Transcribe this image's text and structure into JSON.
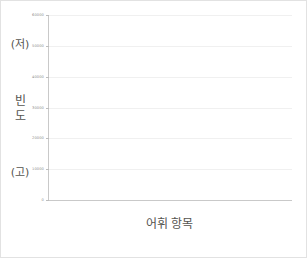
{
  "chart_data": {
    "type": "line",
    "title": "",
    "xlabel": "어휘 항목",
    "ylabel": "빈도",
    "ylim": [
      0,
      60000
    ],
    "grid": true,
    "legend_position": "none",
    "y_ticks": [
      0,
      10000,
      20000,
      30000,
      40000,
      50000,
      60000
    ],
    "y_tick_labels": [
      "0",
      "10000",
      "20000",
      "30000",
      "40000",
      "50000",
      "60000"
    ],
    "x_tick_labels": [],
    "annotations": {
      "y_axis_high_marker": "(저)",
      "y_axis_low_marker": "(고)"
    },
    "series": [
      {
        "name": "solid-curve",
        "style": "solid",
        "color": "#3a3a3a",
        "x": [
          0,
          2,
          4,
          6,
          8,
          10,
          12,
          14,
          16,
          18,
          20,
          22,
          24,
          26,
          28,
          30,
          32,
          34,
          36,
          38,
          40,
          42,
          44,
          46,
          48,
          50,
          52,
          54,
          56,
          58,
          60,
          62,
          64,
          66,
          68,
          70,
          72,
          74,
          76,
          78,
          80,
          82,
          84,
          86,
          88,
          90,
          92,
          94,
          96,
          98,
          100
        ],
        "values": [
          0,
          1500,
          2600,
          3500,
          4300,
          5000,
          5900,
          6800,
          7500,
          8400,
          9300,
          10100,
          10800,
          11800,
          12700,
          13400,
          14200,
          15200,
          16100,
          16800,
          17900,
          19200,
          20400,
          21000,
          21600,
          22400,
          23400,
          24400,
          25300,
          26200,
          27200,
          28100,
          29000,
          30100,
          31300,
          32600,
          33900,
          34900,
          36600,
          38200,
          39300,
          40300,
          41300,
          42500,
          43700,
          45200,
          46900,
          48600,
          50200,
          52800,
          55200
        ]
      },
      {
        "name": "dashed-curve",
        "style": "dashed",
        "color": "#3a3a3a",
        "x": [
          0,
          2,
          4,
          6,
          8,
          10,
          12,
          14,
          16,
          18,
          20,
          22,
          24,
          26,
          28,
          30,
          32,
          34,
          36,
          38,
          40,
          42,
          44,
          46,
          48,
          50,
          52,
          54,
          56,
          58,
          60,
          62,
          64,
          66,
          68,
          70,
          72,
          74,
          76,
          78,
          80,
          82,
          84,
          86,
          88,
          90,
          92,
          94,
          96,
          98,
          100
        ],
        "values": [
          0,
          380,
          700,
          1000,
          1300,
          1600,
          1900,
          2200,
          2500,
          2800,
          3150,
          3500,
          3900,
          4300,
          4700,
          5150,
          5600,
          6100,
          6600,
          7150,
          7700,
          8300,
          8950,
          9650,
          10400,
          11200,
          12100,
          13050,
          14050,
          15100,
          16250,
          17500,
          18850,
          20300,
          21850,
          23500,
          25300,
          27250,
          29350,
          31600,
          34000,
          36550,
          39250,
          42100,
          44800,
          47200,
          49300,
          51200,
          52900,
          54300,
          55200
        ]
      }
    ]
  },
  "axes": {
    "y_title_chars": [
      "빈",
      "도"
    ],
    "y_high_label": "(저)",
    "y_low_label": "(고)",
    "x_title": "어휘 항목"
  },
  "caption": {
    "text": ""
  },
  "colors": {
    "line": "#3a3a3a",
    "grid": "#f0f0f0",
    "axis": "#c9c9c9",
    "text": "#55544f",
    "tick_text": "#8d8d8d",
    "border": "#e2e2e2"
  }
}
